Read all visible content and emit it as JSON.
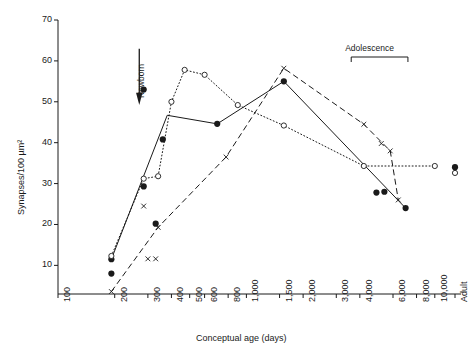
{
  "chart_data": {
    "type": "line",
    "title": "",
    "xlabel": "Conceptual age (days)",
    "ylabel": "Synapses/100 µm²",
    "x_scale": "log",
    "y_scale": "linear",
    "xlim": [
      100,
      13000
    ],
    "ylim": [
      3,
      70
    ],
    "grid": false,
    "legend": "none",
    "y_ticks": [
      10,
      20,
      30,
      40,
      50,
      60,
      70
    ],
    "x_ticks": [
      {
        "value": 100,
        "label": "100"
      },
      {
        "value": 200,
        "label": "200"
      },
      {
        "value": 300,
        "label": "300"
      },
      {
        "value": 400,
        "label": "400"
      },
      {
        "value": 500,
        "label": "500"
      },
      {
        "value": 600,
        "label": "600"
      },
      {
        "value": 800,
        "label": "800"
      },
      {
        "value": 1000,
        "label": "1,000"
      },
      {
        "value": 1500,
        "label": "1,500"
      },
      {
        "value": 2000,
        "label": "2,000"
      },
      {
        "value": 3000,
        "label": "3,000"
      },
      {
        "value": 4000,
        "label": "4,000"
      },
      {
        "value": 6000,
        "label": "6,000"
      },
      {
        "value": 8000,
        "label": "8,000"
      },
      {
        "value": 10000,
        "label": "10,000"
      },
      {
        "value": 12800,
        "label": "Adult"
      }
    ],
    "series": [
      {
        "name": "auditory-cortex",
        "marker": "filled-circle",
        "line": "solid",
        "color": "#1a1a1a",
        "points": [
          {
            "x": 192,
            "y": 11.5
          },
          {
            "x": 192,
            "y": 8.0
          },
          {
            "x": 285,
            "y": 29.3
          },
          {
            "x": 285,
            "y": 53.0
          },
          {
            "x": 330,
            "y": 20.2
          },
          {
            "x": 360,
            "y": 40.8
          },
          {
            "x": 700,
            "y": 44.6
          },
          {
            "x": 1580,
            "y": 55.0
          },
          {
            "x": 4900,
            "y": 27.8
          },
          {
            "x": 5400,
            "y": 28.0
          },
          {
            "x": 7000,
            "y": 24.0
          },
          {
            "x": 12800,
            "y": 34.0
          }
        ],
        "line_points": [
          {
            "x": 192,
            "y": 11.5
          },
          {
            "x": 380,
            "y": 46.7
          },
          {
            "x": 700,
            "y": 44.6
          },
          {
            "x": 1580,
            "y": 55.0
          },
          {
            "x": 7000,
            "y": 24.0
          }
        ]
      },
      {
        "name": "visual-cortex",
        "marker": "open-circle",
        "line": "dotted",
        "color": "#1a1a1a",
        "points": [
          {
            "x": 192,
            "y": 12.3
          },
          {
            "x": 285,
            "y": 31.2
          },
          {
            "x": 340,
            "y": 31.8
          },
          {
            "x": 400,
            "y": 50.0
          },
          {
            "x": 470,
            "y": 57.8
          },
          {
            "x": 600,
            "y": 56.6
          },
          {
            "x": 900,
            "y": 49.2
          },
          {
            "x": 1580,
            "y": 44.2
          },
          {
            "x": 4200,
            "y": 34.3
          },
          {
            "x": 10000,
            "y": 34.3
          },
          {
            "x": 12800,
            "y": 32.6
          }
        ],
        "line_points": [
          {
            "x": 192,
            "y": 12.3
          },
          {
            "x": 285,
            "y": 31.2
          },
          {
            "x": 340,
            "y": 31.8
          },
          {
            "x": 400,
            "y": 50.0
          },
          {
            "x": 470,
            "y": 57.8
          },
          {
            "x": 600,
            "y": 56.6
          },
          {
            "x": 900,
            "y": 49.2
          },
          {
            "x": 1580,
            "y": 44.2
          },
          {
            "x": 4200,
            "y": 34.3
          },
          {
            "x": 10000,
            "y": 34.3
          }
        ]
      },
      {
        "name": "prefrontal-cortex",
        "marker": "cross",
        "line": "dashed",
        "color": "#1a1a1a",
        "points": [
          {
            "x": 192,
            "y": 3.6
          },
          {
            "x": 285,
            "y": 24.5
          },
          {
            "x": 300,
            "y": 11.6
          },
          {
            "x": 330,
            "y": 11.6
          },
          {
            "x": 340,
            "y": 19.3
          },
          {
            "x": 780,
            "y": 36.5
          },
          {
            "x": 1580,
            "y": 58.2
          },
          {
            "x": 4200,
            "y": 44.5
          },
          {
            "x": 5200,
            "y": 39.8
          },
          {
            "x": 5800,
            "y": 38.0
          },
          {
            "x": 6400,
            "y": 26.0
          }
        ],
        "line_points": [
          {
            "x": 192,
            "y": 3.6
          },
          {
            "x": 340,
            "y": 19.3
          },
          {
            "x": 780,
            "y": 36.5
          },
          {
            "x": 1580,
            "y": 58.2
          },
          {
            "x": 4200,
            "y": 44.5
          },
          {
            "x": 5800,
            "y": 38.0
          },
          {
            "x": 6400,
            "y": 26.0
          }
        ]
      }
    ],
    "annotations": [
      {
        "name": "newborn",
        "label": "Newborn",
        "x": 270,
        "type": "arrow-down"
      },
      {
        "name": "adolescence",
        "label": "Adolescence",
        "x_start": 3600,
        "x_end": 7200,
        "type": "bracket"
      }
    ]
  }
}
